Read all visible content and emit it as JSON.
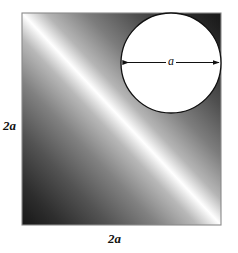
{
  "figure": {
    "background_color": "#ffffff",
    "square": {
      "x": 22,
      "y": 13,
      "width": 199,
      "height": 212,
      "border_color": "#8a8a8a",
      "gradient": {
        "type": "linear-diagonal",
        "direction": "perpendicular-to-main-diagonal",
        "bright_color": "#ffffff",
        "dark_color": "#1b1b1b",
        "mid_color": "#9a9a9a"
      }
    },
    "circle": {
      "center_x": 171,
      "center_y": 63,
      "radius": 50,
      "fill_color": "#ffffff",
      "stroke_color": "#111111",
      "stroke_width": 1.2
    },
    "dimension_arrow": {
      "x1": 122,
      "x2": 220,
      "y": 62,
      "color": "#111111",
      "double_headed": true
    },
    "labels": {
      "left": "2a",
      "bottom": "2a",
      "diameter": "a"
    }
  }
}
